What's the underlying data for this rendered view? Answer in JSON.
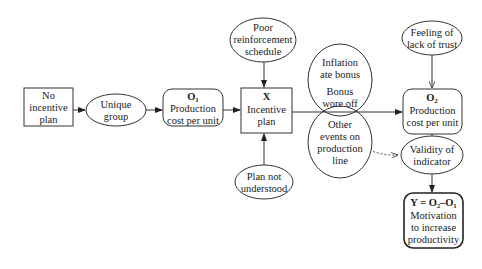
{
  "diagram": {
    "type": "causal-flow",
    "nodes": {
      "no_incentive": {
        "lines": [
          "No",
          "incentive",
          "plan"
        ],
        "shape": "rectangle"
      },
      "unique_group": {
        "lines": [
          "Unique",
          "group"
        ],
        "shape": "ellipse"
      },
      "o1": {
        "title": "O",
        "sub": "1",
        "lines": [
          "Production",
          "cost per unit"
        ],
        "shape": "rounded-rectangle"
      },
      "x": {
        "title": "X",
        "lines": [
          "Incentive",
          "plan"
        ],
        "shape": "rectangle"
      },
      "poor_reinforcement": {
        "lines": [
          "Poor",
          "reinforcement",
          "schedule"
        ],
        "shape": "ellipse"
      },
      "plan_not_understood": {
        "lines": [
          "Plan not",
          "understood"
        ],
        "shape": "ellipse"
      },
      "inflation": {
        "lines": [
          "Inflation",
          "ate bonus",
          "Bonus",
          "wore off"
        ],
        "shape": "ellipse"
      },
      "other_events": {
        "lines": [
          "Other",
          "events on",
          "production",
          "line"
        ],
        "shape": "ellipse"
      },
      "feeling_trust": {
        "lines": [
          "Feeling of",
          "lack of trust"
        ],
        "shape": "ellipse"
      },
      "o2": {
        "title": "O",
        "sub": "2",
        "lines": [
          "Production",
          "cost per unit"
        ],
        "shape": "rounded-rectangle"
      },
      "validity": {
        "lines": [
          "Validity of",
          "indicator"
        ],
        "shape": "ellipse"
      },
      "y": {
        "title": "Y = O₂–O₁",
        "lines": [
          "Motivation",
          "to increase",
          "productivity"
        ],
        "shape": "rounded-rectangle"
      }
    },
    "edges": [
      {
        "from": "no_incentive",
        "to": "unique_group",
        "style": "solid"
      },
      {
        "from": "unique_group",
        "to": "o1",
        "style": "solid"
      },
      {
        "from": "o1",
        "to": "x",
        "style": "solid"
      },
      {
        "from": "poor_reinforcement",
        "to": "x",
        "style": "solid"
      },
      {
        "from": "plan_not_understood",
        "to": "x",
        "style": "solid"
      },
      {
        "from": "x",
        "to": "o2",
        "style": "solid"
      },
      {
        "from": "feeling_trust",
        "to": "o2",
        "style": "solid"
      },
      {
        "from": "o2",
        "to": "validity",
        "style": "solid"
      },
      {
        "from": "other_events",
        "to": "validity",
        "style": "dashed"
      },
      {
        "from": "validity",
        "to": "y",
        "style": "solid"
      }
    ],
    "colors": {
      "stroke": "#333333",
      "fill": "#ffffff",
      "text": "#1a1a1a"
    }
  }
}
